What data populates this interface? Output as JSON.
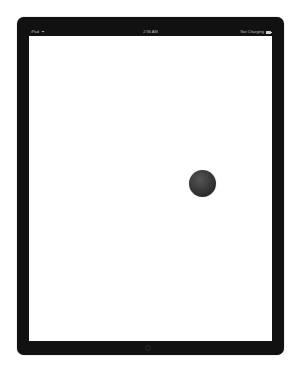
{
  "status_bar": {
    "device_label": "iPad",
    "wifi_icon": "wifi-icon",
    "time": "2:36 AM",
    "charging_status": "Not Charging",
    "battery_icon": "battery-icon"
  },
  "screen": {
    "background": "#ffffff",
    "ball": {
      "color": "#333333",
      "center_x": 173,
      "center_y": 147,
      "diameter": 27
    }
  },
  "frame": {
    "color": "#111111"
  }
}
